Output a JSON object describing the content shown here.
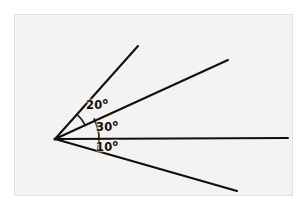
{
  "figure": {
    "background_color": "#ffffff",
    "panel_color": "#f4f3f1",
    "panel_border_color": "#e3e1de",
    "line_color": "#100f0d",
    "text_color": "#100f0d",
    "panel": {
      "x": 14,
      "y": 14,
      "width": 279,
      "height": 182
    },
    "vertex": {
      "x": 55,
      "y": 139,
      "label": "common-vertex"
    },
    "rays": [
      {
        "name": "ray-upper",
        "angle_deg": 47,
        "x1": 55,
        "y1": 139,
        "x2": 138,
        "y2": 46,
        "stroke_width": 2.1
      },
      {
        "name": "ray-middle",
        "angle_deg": 27,
        "x1": 55,
        "y1": 139,
        "x2": 228,
        "y2": 60,
        "stroke_width": 2.1
      },
      {
        "name": "ray-horizontal",
        "angle_deg": 0,
        "x1": 55,
        "y1": 139,
        "x2": 288,
        "y2": 138,
        "stroke_width": 2.1
      },
      {
        "name": "ray-lower",
        "angle_deg": -15,
        "x1": 55,
        "y1": 139,
        "x2": 237,
        "y2": 191,
        "stroke_width": 2.1
      }
    ],
    "arcs": [
      {
        "name": "arc-20deg",
        "radius": 33,
        "from_deg": 27,
        "to_deg": 47,
        "stroke_width": 1.8
      },
      {
        "name": "arc-30-10",
        "radius": 44,
        "from_deg": -15,
        "to_deg": 27,
        "stroke_width": 1.8
      }
    ],
    "labels": [
      {
        "id": "label-20",
        "name": "angle-label-20deg",
        "value": "20",
        "unit": "o",
        "text": "20o",
        "x": 86,
        "y": 98
      },
      {
        "id": "label-30",
        "name": "angle-label-30deg",
        "value": "30",
        "unit": "o",
        "text": "30o",
        "x": 96,
        "y": 120
      },
      {
        "id": "label-10",
        "name": "angle-label-10deg",
        "value": "10",
        "unit": "o",
        "text": "10o",
        "x": 96,
        "y": 140
      }
    ]
  }
}
